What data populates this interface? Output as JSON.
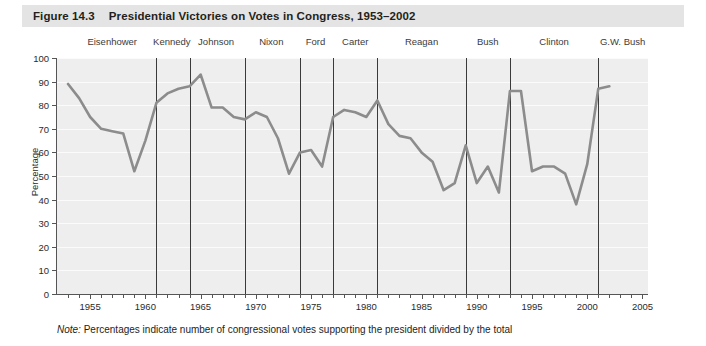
{
  "figure": {
    "number": "Figure 14.3",
    "title": "Presidential Victories on Votes in Congress, 1953–2002",
    "note_prefix": "Note:",
    "note_text": " Percentages indicate number of congressional votes supporting the president divided by the total"
  },
  "presidents": [
    {
      "name": "Eisenhower",
      "start": 1953,
      "end": 1961,
      "center": 1957.0
    },
    {
      "name": "Kennedy",
      "start": 1961,
      "end": 1964,
      "center": 1962.4
    },
    {
      "name": "Johnson",
      "start": 1964,
      "end": 1969,
      "center": 1966.4
    },
    {
      "name": "Nixon",
      "start": 1969,
      "end": 1974,
      "center": 1971.4
    },
    {
      "name": "Ford",
      "start": 1974,
      "end": 1977,
      "center": 1975.4
    },
    {
      "name": "Carter",
      "start": 1977,
      "end": 1981,
      "center": 1979.0
    },
    {
      "name": "Reagan",
      "start": 1981,
      "end": 1989,
      "center": 1985.0
    },
    {
      "name": "Bush",
      "start": 1989,
      "end": 1993,
      "center": 1991.0
    },
    {
      "name": "Clinton",
      "start": 1993,
      "end": 2001,
      "center": 1997.0
    },
    {
      "name": "G.W. Bush",
      "start": 2001,
      "end": 2003,
      "center": 2003.2
    }
  ],
  "colors": {
    "title_bar": "#e4e4e4",
    "plot_background": "#eeeeee",
    "gridline": "#fbfbfb",
    "series_line": "#8c8c8c",
    "axis": "#555555",
    "divider": "#3a3a3a",
    "text": "#231f20"
  },
  "chart_data": {
    "type": "line",
    "title": "Presidential Victories on Votes in Congress, 1953–2002",
    "xlabel": "",
    "ylabel": "Percentage",
    "xlim": [
      1952,
      2005.5
    ],
    "ylim": [
      0,
      100
    ],
    "grid": true,
    "legend": "none",
    "y_ticks": [
      0,
      10,
      20,
      30,
      40,
      50,
      60,
      70,
      80,
      90,
      100
    ],
    "x_ticks_labeled": [
      1955,
      1960,
      1965,
      1970,
      1975,
      1980,
      1985,
      1990,
      1995,
      2000,
      2005
    ],
    "x_tick_interval": 1,
    "series": [
      {
        "name": "Presidential victories on votes in Congress",
        "x": [
          1953,
          1954,
          1955,
          1956,
          1957,
          1958,
          1959,
          1960,
          1961,
          1962,
          1963,
          1964,
          1965,
          1966,
          1967,
          1968,
          1969,
          1970,
          1971,
          1972,
          1973,
          1974,
          1975,
          1976,
          1977,
          1978,
          1979,
          1980,
          1981,
          1982,
          1983,
          1984,
          1985,
          1986,
          1987,
          1988,
          1989,
          1990,
          1991,
          1992,
          1993,
          1994,
          1995,
          1996,
          1997,
          1998,
          1999,
          2000,
          2001,
          2002
        ],
        "values": [
          89,
          83,
          75,
          70,
          69,
          68,
          52,
          65,
          81,
          85,
          87,
          88,
          93,
          79,
          79,
          75,
          74,
          77,
          75,
          66,
          51,
          60,
          61,
          54,
          75,
          78,
          77,
          75,
          82,
          72,
          67,
          66,
          60,
          56,
          44,
          47,
          63,
          47,
          54,
          43,
          86,
          86,
          52,
          54,
          54,
          51,
          38,
          55,
          87,
          88
        ]
      }
    ]
  }
}
